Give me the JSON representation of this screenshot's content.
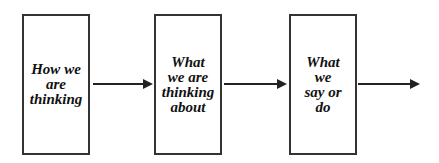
{
  "diagram": {
    "type": "flow",
    "boxes": [
      {
        "label": "How we\nare\nthinking"
      },
      {
        "label": "What\nwe are\nthinking\nabout"
      },
      {
        "label": "What\nwe\nsay or\ndo"
      }
    ],
    "arrows": [
      {
        "from": 0,
        "to": 1
      },
      {
        "from": 1,
        "to": 2
      },
      {
        "from": 2,
        "to": "outward"
      }
    ]
  }
}
